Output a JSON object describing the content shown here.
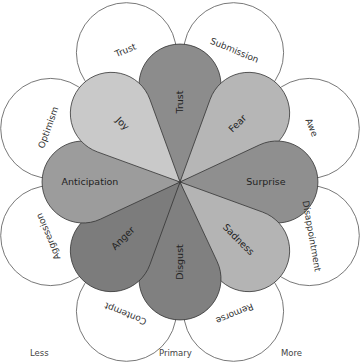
{
  "diagram": {
    "center": [
      180,
      182
    ],
    "primary_emotions": [
      {
        "label": "Trust",
        "angle": 0,
        "color": "#8c8c8c"
      },
      {
        "label": "Fear",
        "angle": 45,
        "color": "#b6b6b6"
      },
      {
        "label": "Surprise",
        "angle": 90,
        "color": "#8f8f8f"
      },
      {
        "label": "Sadness",
        "angle": 135,
        "color": "#b4b4b4"
      },
      {
        "label": "Disgust",
        "angle": 180,
        "color": "#808080"
      },
      {
        "label": "Anger",
        "angle": 225,
        "color": "#7c7c7c"
      },
      {
        "label": "Anticipation",
        "angle": 270,
        "color": "#9c9c9c"
      },
      {
        "label": "Joy",
        "angle": 315,
        "color": "#c9c9c9"
      }
    ],
    "secondary_emotions": [
      {
        "label": "Submission",
        "angle": 22.5
      },
      {
        "label": "Awe",
        "angle": 67.5
      },
      {
        "label": "Disappointment",
        "angle": 112.5
      },
      {
        "label": "Remorse",
        "angle": 157.5
      },
      {
        "label": "Contempt",
        "angle": 202.5
      },
      {
        "label": "Aggression",
        "angle": 247.5
      },
      {
        "label": "Optimism",
        "angle": 292.5
      },
      {
        "label": "Trust",
        "angle": 337.5
      }
    ]
  },
  "legend": {
    "less": "Less",
    "primary": "Primary",
    "more": "More"
  }
}
